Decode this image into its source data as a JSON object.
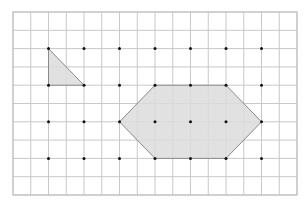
{
  "figure": {
    "grid": {
      "columns": 16,
      "rows": 10,
      "line_color": "#c8c8c8",
      "border_color": "#bdbdbd"
    },
    "dots": {
      "columns": [
        2,
        4,
        6,
        8,
        10,
        12,
        14
      ],
      "rows": [
        2,
        4,
        6,
        8
      ],
      "color": "#111111"
    },
    "shapes": [
      {
        "name": "triangle",
        "fill": "#dcdcdc",
        "stroke": "#8a8a8a",
        "vertices": [
          [
            2,
            2
          ],
          [
            2,
            4
          ],
          [
            4,
            4
          ]
        ]
      },
      {
        "name": "hexagon",
        "fill": "#dcdcdc",
        "stroke": "#8a8a8a",
        "vertices": [
          [
            6,
            6
          ],
          [
            8,
            4
          ],
          [
            12,
            4
          ],
          [
            14,
            6
          ],
          [
            12,
            8
          ],
          [
            8,
            8
          ]
        ]
      }
    ]
  }
}
